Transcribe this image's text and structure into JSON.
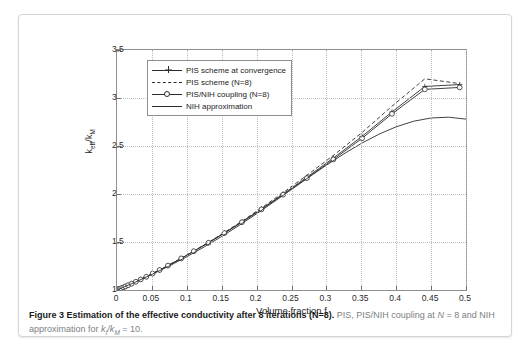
{
  "figure": {
    "xlabel": "Volume fraction f",
    "ylabel_main": "k",
    "ylabel_sub1": "eff",
    "ylabel_mid": "/k",
    "ylabel_sub2": "M"
  },
  "caption": {
    "bold": "Figure 3 Estimation of the effective conductivity after 8 iterations (N=8).",
    "rest_a": " PIS, PIS/NIH coupling at ",
    "rest_n": "N",
    "rest_eq": " = 8",
    "rest_b": " and NIH approximation for ",
    "rest_k1": "k",
    "rest_k1sub": "I",
    "rest_slash": "/k",
    "rest_k2sub": "M",
    "rest_c": " = 10."
  },
  "legend": {
    "items": [
      {
        "label": "PIS scheme at convergence",
        "style": "solid-plus"
      },
      {
        "label": "PIS scheme (N=8)",
        "style": "dashed"
      },
      {
        "label": "PIS/NIH coupling (N=8)",
        "style": "solid-circle"
      },
      {
        "label": "NIH approximation",
        "style": "solid"
      }
    ]
  },
  "chart_data": {
    "type": "line",
    "title": "Estimation of the effective conductivity after 8 iterations (N=8)",
    "xlabel": "Volume fraction f",
    "ylabel": "k_eff/k_M",
    "xlim": [
      0,
      0.5
    ],
    "ylim": [
      1,
      3.5
    ],
    "xticks": [
      0,
      0.05,
      0.1,
      0.15,
      0.2,
      0.25,
      0.3,
      0.35,
      0.4,
      0.45,
      0.5
    ],
    "xticklabels": [
      "0",
      "0.05",
      "0.1",
      "0.15",
      "0.2",
      "0.25",
      "0.3",
      "0.35",
      "0.4",
      "0.45",
      "0.5"
    ],
    "yticks": [
      1,
      1.5,
      2,
      2.5,
      3,
      3.5
    ],
    "yticklabels": [
      "1",
      "1.5",
      "2",
      "2.5",
      "3",
      "3.5"
    ],
    "grid": true,
    "legend_position": "upper left",
    "series": [
      {
        "name": "PIS scheme at convergence",
        "marker": "plus",
        "linestyle": "solid",
        "x": [
          0.0,
          0.002,
          0.004,
          0.006,
          0.009,
          0.012,
          0.016,
          0.021,
          0.027,
          0.034,
          0.042,
          0.051,
          0.061,
          0.073,
          0.092,
          0.11,
          0.131,
          0.154,
          0.179,
          0.207,
          0.238,
          0.272,
          0.31,
          0.351,
          0.394,
          0.441,
          0.491
        ],
        "y": [
          1.0,
          1.006,
          1.012,
          1.018,
          1.027,
          1.037,
          1.05,
          1.066,
          1.086,
          1.11,
          1.138,
          1.171,
          1.208,
          1.254,
          1.329,
          1.404,
          1.493,
          1.595,
          1.71,
          1.845,
          2.0,
          2.175,
          2.375,
          2.6,
          2.855,
          3.12,
          3.14
        ]
      },
      {
        "name": "PIS scheme (N=8)",
        "marker": "none",
        "linestyle": "dashed",
        "x": [
          0.0,
          0.002,
          0.004,
          0.006,
          0.009,
          0.012,
          0.016,
          0.021,
          0.027,
          0.034,
          0.042,
          0.051,
          0.061,
          0.073,
          0.092,
          0.11,
          0.131,
          0.154,
          0.179,
          0.207,
          0.238,
          0.272,
          0.31,
          0.351,
          0.394,
          0.441,
          0.491
        ],
        "y": [
          1.0,
          1.006,
          1.012,
          1.018,
          1.027,
          1.037,
          1.05,
          1.066,
          1.086,
          1.11,
          1.138,
          1.171,
          1.208,
          1.254,
          1.33,
          1.406,
          1.496,
          1.6,
          1.717,
          1.855,
          2.014,
          2.195,
          2.402,
          2.64,
          2.915,
          3.2,
          3.15
        ]
      },
      {
        "name": "PIS/NIH coupling (N=8)",
        "marker": "circle",
        "linestyle": "solid",
        "x": [
          0.0,
          0.002,
          0.004,
          0.006,
          0.009,
          0.012,
          0.016,
          0.021,
          0.027,
          0.034,
          0.042,
          0.051,
          0.061,
          0.073,
          0.092,
          0.11,
          0.131,
          0.154,
          0.179,
          0.207,
          0.238,
          0.272,
          0.31,
          0.351,
          0.394,
          0.441,
          0.491
        ],
        "y": [
          1.0,
          1.006,
          1.012,
          1.018,
          1.027,
          1.037,
          1.05,
          1.066,
          1.086,
          1.11,
          1.138,
          1.171,
          1.208,
          1.254,
          1.329,
          1.404,
          1.492,
          1.593,
          1.706,
          1.84,
          1.993,
          2.165,
          2.36,
          2.58,
          2.835,
          3.09,
          3.11
        ]
      },
      {
        "name": "NIH approximation",
        "marker": "none",
        "linestyle": "solid",
        "x": [
          0.0,
          0.025,
          0.05,
          0.075,
          0.1,
          0.125,
          0.15,
          0.175,
          0.2,
          0.225,
          0.25,
          0.275,
          0.3,
          0.325,
          0.35,
          0.375,
          0.4,
          0.425,
          0.45,
          0.475,
          0.5
        ],
        "y": [
          1.0,
          1.078,
          1.162,
          1.251,
          1.347,
          1.449,
          1.558,
          1.673,
          1.794,
          1.919,
          2.047,
          2.175,
          2.3,
          2.418,
          2.527,
          2.622,
          2.7,
          2.758,
          2.792,
          2.8,
          2.78
        ]
      }
    ]
  }
}
